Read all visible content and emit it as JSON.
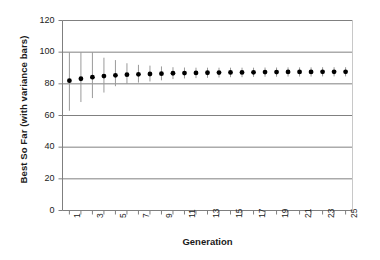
{
  "chart_data": {
    "type": "scatter",
    "title": "",
    "xlabel": "Generation",
    "ylabel": "Best So Far (with variance bars)",
    "xlim": [
      0.4,
      25.6
    ],
    "ylim": [
      0,
      120
    ],
    "yticks": [
      0,
      20,
      40,
      60,
      80,
      100,
      120
    ],
    "xticks": [
      1,
      2,
      3,
      4,
      5,
      6,
      7,
      8,
      9,
      10,
      11,
      12,
      13,
      14,
      15,
      16,
      17,
      18,
      19,
      20,
      21,
      22,
      23,
      24,
      25
    ],
    "xtick_labels_shown": [
      "1",
      "3",
      "5",
      "7",
      "9",
      "11",
      "13",
      "15",
      "17",
      "19",
      "21",
      "23",
      "25"
    ],
    "grid": "horizontal",
    "legend": "none",
    "marker": "filled-circle",
    "marker_color": "#000000",
    "errorbar_color": "#9a9a9a",
    "axis_color": "#7f7f7f",
    "grid_color": "#808080",
    "x": [
      1,
      2,
      3,
      4,
      5,
      6,
      7,
      8,
      9,
      10,
      11,
      12,
      13,
      14,
      15,
      16,
      17,
      18,
      19,
      20,
      21,
      22,
      23,
      24,
      25
    ],
    "values": [
      82.0,
      83.2,
      84.2,
      84.9,
      85.4,
      85.8,
      86.0,
      86.2,
      86.4,
      86.7,
      86.8,
      86.9,
      87.0,
      87.1,
      87.2,
      87.2,
      87.3,
      87.4,
      87.4,
      87.5,
      87.5,
      87.5,
      87.6,
      87.6,
      87.6
    ],
    "err_low": [
      63.0,
      68.5,
      71.0,
      74.5,
      78.5,
      80.0,
      80.8,
      81.5,
      82.2,
      83.0,
      83.4,
      83.6,
      83.8,
      84.0,
      84.2,
      84.2,
      84.4,
      84.5,
      84.5,
      84.6,
      84.6,
      84.6,
      84.7,
      84.7,
      84.7
    ],
    "err_high": [
      100.0,
      100.0,
      100.0,
      96.5,
      95.0,
      93.0,
      92.0,
      91.5,
      91.0,
      90.5,
      90.3,
      90.2,
      90.2,
      90.2,
      90.2,
      90.2,
      90.2,
      90.3,
      90.3,
      90.4,
      90.4,
      90.4,
      90.5,
      90.5,
      90.5
    ]
  }
}
